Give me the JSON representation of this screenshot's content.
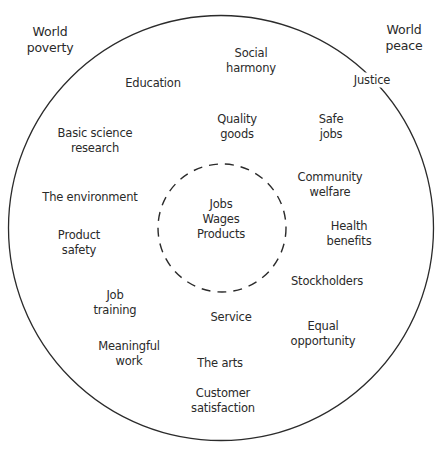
{
  "diagram": {
    "title": "",
    "outside": {
      "left": "World\npoverty",
      "right": "World\npeace"
    },
    "core": "Jobs\nWages\nProducts",
    "stakes": {
      "justice": "Justice",
      "social_harmony": "Social\nharmony",
      "education": "Education",
      "quality_goods": "Quality\ngoods",
      "safe_jobs": "Safe\njobs",
      "basic_science": "Basic science\nresearch",
      "community_welfare": "Community\nwelfare",
      "environment": "The environment",
      "health_benefits": "Health\nbenefits",
      "product_safety": "Product\nsafety",
      "stockholders": "Stockholders",
      "job_training": "Job\ntraining",
      "service": "Service",
      "equal_opportunity": "Equal\nopportunity",
      "meaningful_work": "Meaningful\nwork",
      "the_arts": "The arts",
      "customer_satisfaction": "Customer\nsatisfaction"
    },
    "colors": {
      "line": "#2b2b2b",
      "text": "#2a2a2a",
      "background": "#ffffff"
    }
  }
}
